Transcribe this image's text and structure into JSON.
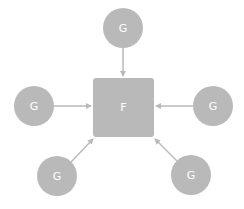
{
  "diagram": {
    "colors": {
      "node": "#b9b9b9",
      "edge": "#b9b9b9",
      "label": "#ffffff",
      "background": "#ffffff"
    },
    "center": {
      "label": "F",
      "x": 93,
      "y": 78,
      "w": 61,
      "h": 59
    },
    "nodes": [
      {
        "id": "top",
        "label": "G",
        "cx": 123,
        "cy": 28,
        "r": 20
      },
      {
        "id": "left",
        "label": "G",
        "cx": 34,
        "cy": 106,
        "r": 20
      },
      {
        "id": "right",
        "label": "G",
        "cx": 213,
        "cy": 106,
        "r": 20
      },
      {
        "id": "bottom-left",
        "label": "G",
        "cx": 57,
        "cy": 176,
        "r": 20
      },
      {
        "id": "bottom-right",
        "label": "G",
        "cx": 191,
        "cy": 175,
        "r": 20
      }
    ],
    "edges": [
      {
        "from": "top",
        "to": "F"
      },
      {
        "from": "left",
        "to": "F"
      },
      {
        "from": "right",
        "to": "F"
      },
      {
        "from": "bottom-left",
        "to": "F"
      },
      {
        "from": "bottom-right",
        "to": "F"
      }
    ]
  }
}
